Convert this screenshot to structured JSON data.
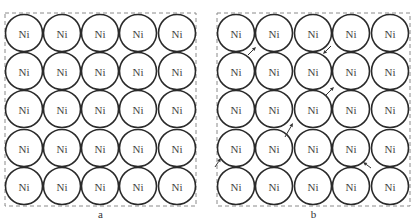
{
  "figure": {
    "panels": [
      {
        "id": "a",
        "label": "a",
        "frame": {
          "x": 5,
          "y": 13,
          "w": 191,
          "h": 193
        },
        "grid": {
          "rows": 5,
          "cols": 5,
          "cx": [
            24,
            62,
            100,
            138,
            177
          ],
          "cy": [
            33,
            71,
            109,
            148,
            186
          ],
          "r": 18.5
        },
        "atom_label": "Ni",
        "arrows": []
      },
      {
        "id": "b",
        "label": "b",
        "frame": {
          "x": 217,
          "y": 13,
          "w": 193,
          "h": 193
        },
        "grid": {
          "rows": 5,
          "cols": 5,
          "cx": [
            236,
            274,
            313,
            351,
            390
          ],
          "cy": [
            33,
            71,
            109,
            148,
            186
          ],
          "r": 18.5
        },
        "atom_label": "Ni",
        "arrows": [
          {
            "x1": 248,
            "y1": 55,
            "x2": 256,
            "y2": 47
          },
          {
            "x1": 331,
            "y1": 46,
            "x2": 323,
            "y2": 54
          },
          {
            "x1": 326,
            "y1": 95,
            "x2": 334,
            "y2": 87
          },
          {
            "x1": 285,
            "y1": 137,
            "x2": 293,
            "y2": 123
          },
          {
            "x1": 215,
            "y1": 167,
            "x2": 221,
            "y2": 158
          },
          {
            "x1": 371,
            "y1": 168,
            "x2": 363,
            "y2": 162
          }
        ]
      }
    ],
    "colors": {
      "atom_stroke": "#2a2a2a",
      "frame_stroke": "#8a8a8a",
      "text": "#444444"
    }
  }
}
